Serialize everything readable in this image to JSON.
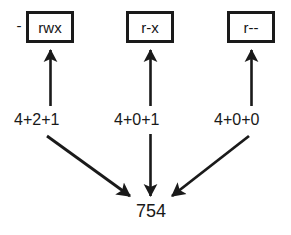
{
  "diagram": {
    "stroke_color": "#1a1a1a",
    "text_color": "#191919",
    "background": "#ffffff",
    "leading_dash": "-",
    "boxes": [
      {
        "id": "owner",
        "label": "rwx"
      },
      {
        "id": "group",
        "label": "r-x"
      },
      {
        "id": "other",
        "label": "r--"
      }
    ],
    "sums": [
      {
        "id": "owner",
        "label": "4+2+1",
        "value": 7
      },
      {
        "id": "group",
        "label": "4+0+1",
        "value": 5
      },
      {
        "id": "other",
        "label": "4+0+0",
        "value": 4
      }
    ],
    "total": "754",
    "arrows": [
      {
        "name": "arrow-up-owner",
        "direction": "up",
        "from": "4+2+1",
        "to": "rwx"
      },
      {
        "name": "arrow-up-group",
        "direction": "up",
        "from": "4+0+1",
        "to": "r-x"
      },
      {
        "name": "arrow-up-other",
        "direction": "up",
        "from": "4+0+0",
        "to": "r--"
      },
      {
        "name": "arrow-down-owner",
        "direction": "down-right",
        "from": "4+2+1",
        "to": "754"
      },
      {
        "name": "arrow-down-group",
        "direction": "down",
        "from": "4+0+1",
        "to": "754"
      },
      {
        "name": "arrow-down-other",
        "direction": "down-left",
        "from": "4+0+0",
        "to": "754"
      }
    ]
  }
}
